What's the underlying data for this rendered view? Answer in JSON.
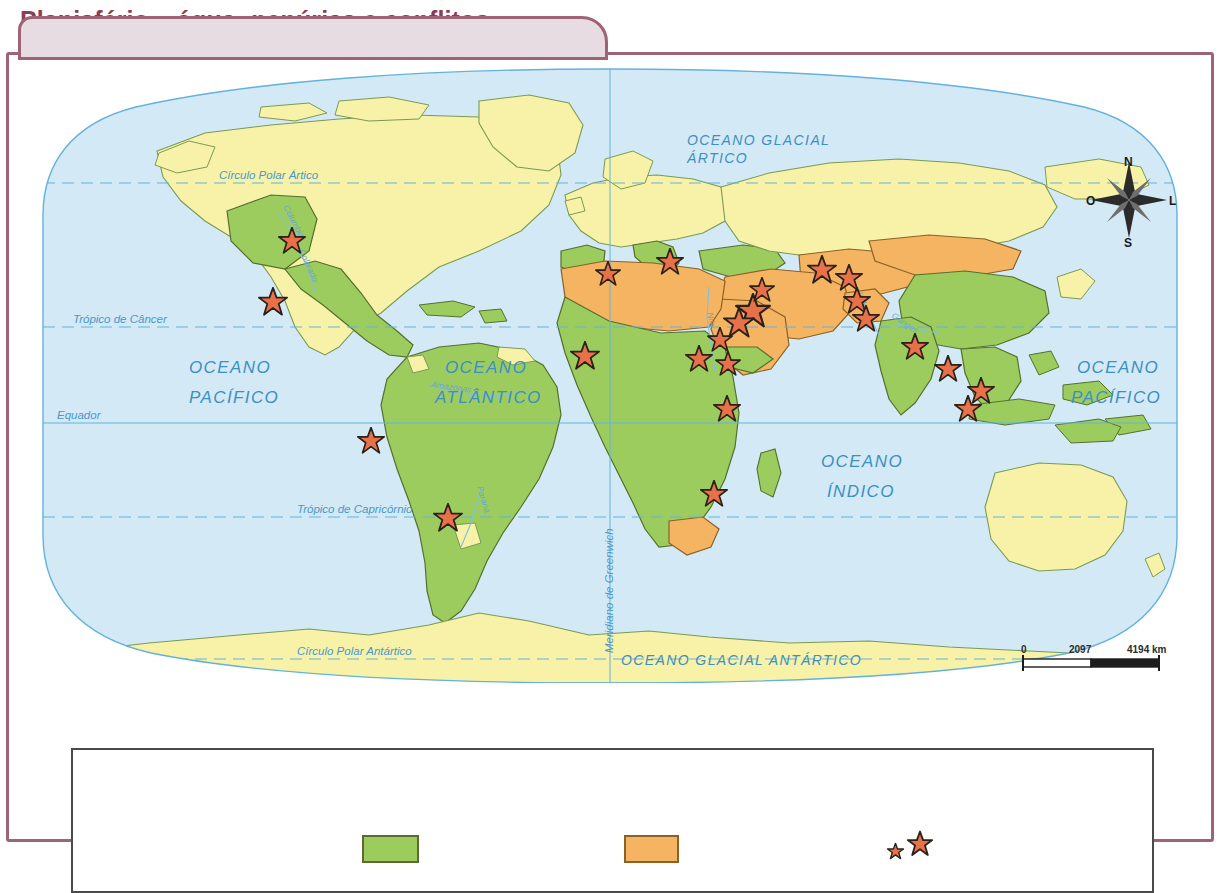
{
  "title": "Planisfério – água: penúrias e conflitos",
  "map": {
    "oceans": [
      {
        "name": "oceano-glacial-artico",
        "lines": [
          "OCEANO GLACIAL",
          "ÁRTICO"
        ]
      },
      {
        "name": "oceano-pacifico-oeste",
        "lines": [
          "OCEANO",
          "PACÍFICO"
        ]
      },
      {
        "name": "oceano-atlantico",
        "lines": [
          "OCEANO",
          "ATLÂNTICO"
        ]
      },
      {
        "name": "oceano-indico",
        "lines": [
          "OCEANO",
          "ÍNDICO"
        ]
      },
      {
        "name": "oceano-pacifico-leste",
        "lines": [
          "OCEANO",
          "PACÍFICO"
        ]
      },
      {
        "name": "oceano-glacial-antartico",
        "lines": [
          "OCEANO GLACIAL ANTÁRTICO"
        ]
      }
    ],
    "latitude_lines": [
      {
        "name": "circulo-polar-artico",
        "label": "Círculo Polar Ártico"
      },
      {
        "name": "tropico-de-cancer",
        "label": "Trópico de Câncer"
      },
      {
        "name": "equador",
        "label": "Equador"
      },
      {
        "name": "tropico-de-capricornio",
        "label": "Trópico de Capricórnio"
      },
      {
        "name": "circulo-polar-antartico",
        "label": "Círculo Polar Antártico"
      }
    ],
    "meridian_label": "Meridiano de Greenwich",
    "rivers": [
      "Columbia",
      "Colorado",
      "Amazonas",
      "Paraná",
      "Nilo",
      "Indus",
      "Ganges"
    ],
    "compass": {
      "north": "N",
      "south": "S",
      "east": "L",
      "west": "O"
    },
    "scale": {
      "start": "0",
      "middle": "2097",
      "end": "4194 km"
    }
  },
  "legend": {
    "items": [
      {
        "name": "legend-green-swatch",
        "color": "#9ccc5e",
        "label": ""
      },
      {
        "name": "legend-orange-swatch",
        "color": "#f5b461",
        "label": ""
      },
      {
        "name": "legend-star-symbols",
        "color": "#e8714a",
        "label": ""
      }
    ]
  },
  "colors": {
    "frame": "#9e6476",
    "title_bg": "#e7dce1",
    "title_text": "#8d3b56",
    "ocean": "#cfe9f5",
    "land_plain": "#f7f2a8",
    "land_green": "#9ccc5e",
    "land_orange": "#f5b461",
    "star": "#e8714a",
    "graticule": "#63b2dd"
  }
}
